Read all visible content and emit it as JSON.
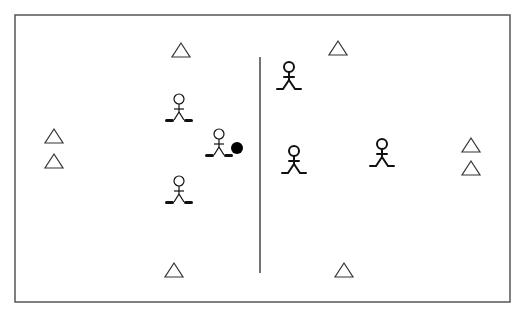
{
  "diagram": {
    "type": "sports-drill",
    "colors": {
      "background": "#ffffff",
      "border": "#555555",
      "midline": "#444444",
      "cone": "#333333",
      "player": "#111111",
      "ball": "#000000"
    },
    "field": {
      "x": 15,
      "y": 15,
      "width": 495,
      "height": 287
    },
    "midline": {
      "x": 260,
      "y1": 57,
      "y2": 273
    },
    "cones": [
      {
        "id": "cone-top-left",
        "x": 181,
        "y": 50
      },
      {
        "id": "cone-top-right",
        "x": 338,
        "y": 48
      },
      {
        "id": "cone-left-upper",
        "x": 54,
        "y": 136
      },
      {
        "id": "cone-left-lower",
        "x": 54,
        "y": 161
      },
      {
        "id": "cone-right-upper",
        "x": 471,
        "y": 145
      },
      {
        "id": "cone-right-lower",
        "x": 471,
        "y": 168
      },
      {
        "id": "cone-bottom-left",
        "x": 174,
        "y": 270
      },
      {
        "id": "cone-bottom-right",
        "x": 344,
        "y": 270
      }
    ],
    "team_a": {
      "label": "Team A (with sticks)",
      "players": [
        {
          "id": "a1",
          "x": 179,
          "y": 110
        },
        {
          "id": "a2",
          "x": 219,
          "y": 145
        },
        {
          "id": "a3",
          "x": 179,
          "y": 192
        }
      ]
    },
    "team_b": {
      "label": "Team B",
      "players": [
        {
          "id": "b1",
          "x": 289,
          "y": 78
        },
        {
          "id": "b2",
          "x": 294,
          "y": 162
        },
        {
          "id": "b3",
          "x": 382,
          "y": 155
        }
      ]
    },
    "ball": {
      "x": 237,
      "y": 148,
      "r": 6
    }
  }
}
